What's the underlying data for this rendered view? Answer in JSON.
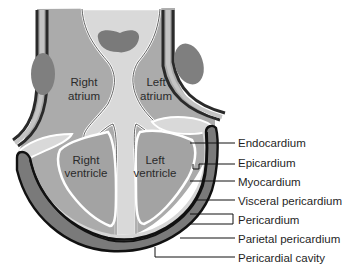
{
  "diagram": {
    "chambers": [
      {
        "id": "right-atrium",
        "line1": "Right",
        "line2": "atrium"
      },
      {
        "id": "left-atrium",
        "line1": "Left",
        "line2": "atrium"
      },
      {
        "id": "right-ventricle",
        "line1": "Right",
        "line2": "ventricle"
      },
      {
        "id": "left-ventricle",
        "line1": "Left",
        "line2": "ventricle"
      }
    ],
    "callouts": [
      {
        "id": "endocardium",
        "label": "Endocardium"
      },
      {
        "id": "epicardium",
        "label": "Epicardium"
      },
      {
        "id": "myocardium",
        "label": "Myocardium"
      },
      {
        "id": "visceral-pericardium",
        "label": "Visceral pericardium"
      },
      {
        "id": "pericardium",
        "label": "Pericardium"
      },
      {
        "id": "parietal-pericardium",
        "label": "Parietal pericardium"
      },
      {
        "id": "pericardial-cavity",
        "label": "Pericardial cavity"
      }
    ],
    "colors": {
      "background": "#ffffff",
      "myocardium_fill": "#a9a9a9",
      "chamber_fill": "#d4d4d4",
      "pericardium_fill": "#7a7a7a",
      "outline": "#1a1a1a",
      "blob_fill": "#808080"
    }
  }
}
